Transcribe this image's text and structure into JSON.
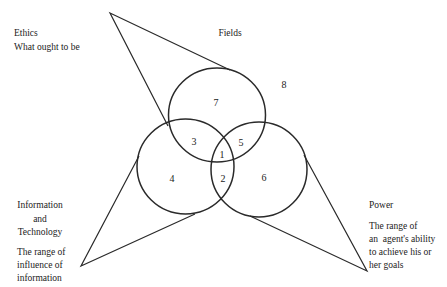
{
  "diagram": {
    "type": "venn-3-circles-with-pointers",
    "circles": [
      {
        "id": "top",
        "role": "Fields"
      },
      {
        "id": "left",
        "role": "Information and Technology"
      },
      {
        "id": "right",
        "role": "Power"
      }
    ],
    "regions": {
      "center": "1",
      "left_right": "2",
      "top_left": "3",
      "left_only": "4",
      "top_right": "5",
      "right_only": "6",
      "top_only": "7",
      "outside": "8"
    },
    "labels": {
      "ethics": {
        "title": "Ethics",
        "subtitle": "What ought to be"
      },
      "fields": {
        "title": "Fields"
      },
      "info_tech": {
        "title_lines": [
          "Information",
          "and",
          "Technology"
        ],
        "desc_lines": [
          "The range of",
          "influence of",
          "information"
        ]
      },
      "power": {
        "title": "Power",
        "desc_lines": [
          "The range of",
          "an  agent's ability",
          "to achieve his or",
          "her goals"
        ]
      }
    },
    "colors": {
      "stroke": "#2a2a2a",
      "text": "#222222",
      "background": "#ffffff"
    }
  }
}
